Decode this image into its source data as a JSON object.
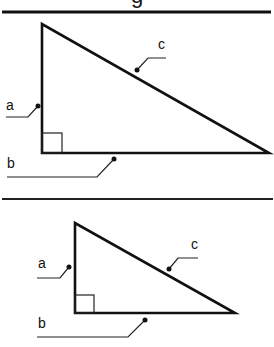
{
  "title_fragment": "g",
  "colors": {
    "ink": "#111111",
    "background": "#ffffff"
  },
  "diagrams": [
    {
      "name": "large-right-triangle",
      "labels": {
        "a": "a",
        "b": "b",
        "c": "c"
      }
    },
    {
      "name": "small-right-triangle",
      "labels": {
        "a": "a",
        "b": "b",
        "c": "c"
      }
    }
  ]
}
